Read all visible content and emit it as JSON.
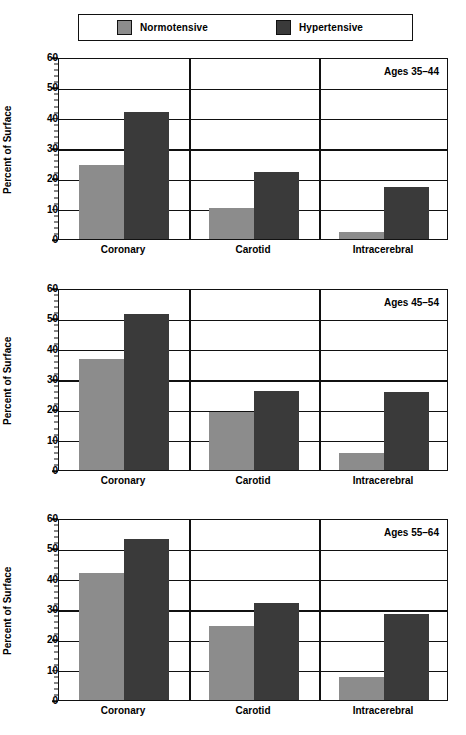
{
  "legend": {
    "entries": [
      {
        "label": "Normotensive",
        "color": "#8c8c8c",
        "key": "normotensive"
      },
      {
        "label": "Hypertensive",
        "color": "#3a3a3a",
        "key": "hypertensive"
      }
    ]
  },
  "axis": {
    "ylabel": "Percent of Surface",
    "yticks": [
      0,
      10,
      20,
      30,
      40,
      50,
      60
    ],
    "ymin": 0,
    "ymax": 60,
    "minor_tick_step": 2
  },
  "categories": [
    "Coronary",
    "Carotid",
    "Intracerebral"
  ],
  "panels": [
    {
      "annotation": "Ages 35–44",
      "values": {
        "normotensive": [
          24.5,
          10.3,
          2.2
        ],
        "hypertensive": [
          42.0,
          22.2,
          17.2
        ]
      }
    },
    {
      "annotation": "Ages 45–54",
      "values": {
        "normotensive": [
          36.5,
          19.0,
          5.7
        ],
        "hypertensive": [
          51.5,
          26.0,
          25.7
        ]
      }
    },
    {
      "annotation": "Ages 55–64",
      "values": {
        "normotensive": [
          42.0,
          24.3,
          7.7
        ],
        "hypertensive": [
          53.0,
          32.0,
          28.3
        ]
      }
    }
  ],
  "chart_data": {
    "type": "bar",
    "title": "",
    "xlabel": "",
    "ylabel": "Percent of Surface",
    "ylim": [
      0,
      60
    ],
    "ytick_step": 10,
    "minor_ytick_step": 2,
    "grid": "horizontal-major",
    "legend_position": "top",
    "categories": [
      "Coronary",
      "Carotid",
      "Intracerebral"
    ],
    "panels": [
      {
        "annotation": "Ages 35–44",
        "series": [
          {
            "name": "Normotensive",
            "color": "#8c8c8c",
            "values": [
              24.5,
              10.3,
              2.2
            ]
          },
          {
            "name": "Hypertensive",
            "color": "#3a3a3a",
            "values": [
              42.0,
              22.2,
              17.2
            ]
          }
        ]
      },
      {
        "annotation": "Ages 45–54",
        "series": [
          {
            "name": "Normotensive",
            "color": "#8c8c8c",
            "values": [
              36.5,
              19.0,
              5.7
            ]
          },
          {
            "name": "Hypertensive",
            "color": "#3a3a3a",
            "values": [
              51.5,
              26.0,
              25.7
            ]
          }
        ]
      },
      {
        "annotation": "Ages 55–64",
        "series": [
          {
            "name": "Normotensive",
            "color": "#8c8c8c",
            "values": [
              42.0,
              24.3,
              7.7
            ]
          },
          {
            "name": "Hypertensive",
            "color": "#3a3a3a",
            "values": [
              53.0,
              32.0,
              28.3
            ]
          }
        ]
      }
    ]
  }
}
